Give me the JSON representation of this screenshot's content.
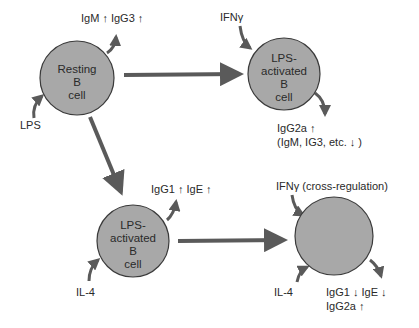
{
  "colors": {
    "cell_fill": "#a8a8a8",
    "cell_stroke": "#3a3a3a",
    "arrow": "#5a5a5a",
    "text": "#2a2a2a",
    "background": "#ffffff"
  },
  "cells": {
    "resting": {
      "line1": "Resting",
      "line2": "B",
      "line3": "cell"
    },
    "lps_activated_top": {
      "line1": "LPS-",
      "line2": "activated",
      "line3": "B",
      "line4": "cell"
    },
    "lps_activated_bottom": {
      "line1": "LPS-",
      "line2": "activated",
      "line3": "B",
      "line4": "cell"
    },
    "cross_regulated": {}
  },
  "labels": {
    "resting_output": "IgM ↑ IgG3 ↑",
    "resting_input": "LPS",
    "top_right_input": "IFNγ",
    "top_right_output_line1": "IgG2a ↑",
    "top_right_output_line2": "(IgM, IG3, etc. ↓ )",
    "bottom_left_output": "IgG1 ↑ IgE ↑",
    "bottom_left_input": "IL-4",
    "bottom_right_input_top": "IFNγ (cross-regulation)",
    "bottom_right_input_left": "IL-4",
    "bottom_right_output_line1": "IgG1 ↓ IgE ↓",
    "bottom_right_output_line2": "IgG2a ↑"
  }
}
